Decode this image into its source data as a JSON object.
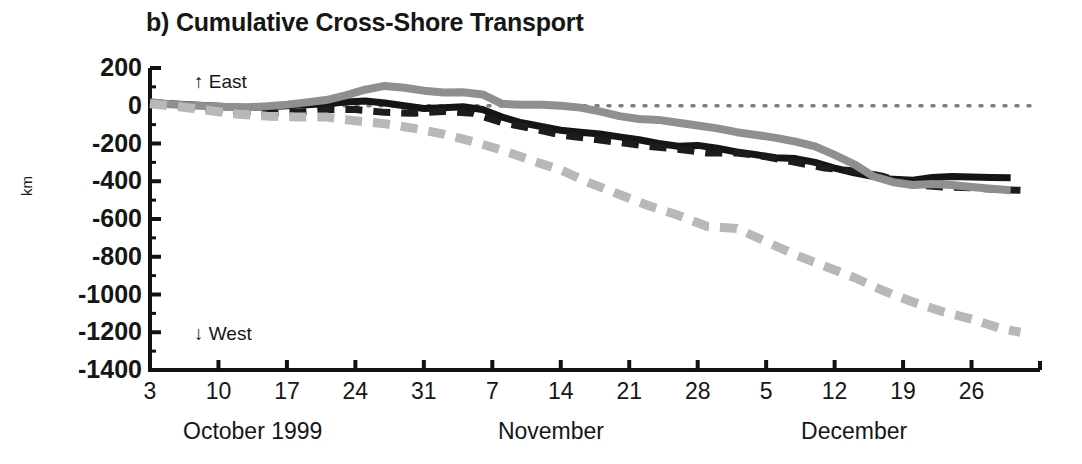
{
  "chart_data": {
    "type": "line",
    "title": "b) Cumulative Cross-Shore Transport",
    "xlabel": "",
    "ylabel": "km",
    "ylim": [
      -1400,
      200
    ],
    "yticks": [
      200,
      0,
      -200,
      -400,
      -600,
      -800,
      -1000,
      -1200,
      -1400
    ],
    "ytick_labels": [
      "200",
      "0",
      "-200",
      "-400",
      "-600",
      "-800",
      "-1000",
      "-1200",
      "-1400"
    ],
    "y_minor_ticks": [
      100,
      -100,
      -300,
      -500,
      -700,
      -900,
      -1100,
      -1300
    ],
    "grid": false,
    "legend": "none",
    "xlim_days": [
      0,
      91
    ],
    "xtick_labels": [
      "3",
      "10",
      "17",
      "24",
      "31",
      "7",
      "14",
      "21",
      "28",
      "5",
      "12",
      "19",
      "26"
    ],
    "xtick_days": [
      0,
      7,
      14,
      21,
      28,
      35,
      42,
      49,
      56,
      63,
      70,
      77,
      84
    ],
    "month_labels": [
      "October 1999",
      "November",
      "December"
    ],
    "month_label_days": [
      10.5,
      41,
      72
    ],
    "annotations": [
      {
        "text": "↑ East",
        "day": 4.5,
        "value": 120
      },
      {
        "text": "↓ West",
        "day": 4.5,
        "value": -1215
      }
    ],
    "reference_line": {
      "value": 0,
      "style": "dotted",
      "color": "#7d7d7d"
    },
    "series": [
      {
        "name": "series-black-solid",
        "color": "#151515",
        "style": "solid",
        "width": 7,
        "x": [
          0,
          2,
          4,
          6,
          8,
          10,
          12,
          14,
          16,
          18,
          20,
          22,
          24,
          26,
          28,
          30,
          32,
          34,
          36,
          38,
          40,
          42,
          44,
          46,
          48,
          50,
          52,
          54,
          56,
          58,
          60,
          62,
          64,
          66,
          68,
          70,
          72,
          74,
          76,
          78,
          80,
          82,
          84,
          86,
          88
        ],
        "y": [
          20,
          10,
          5,
          0,
          -5,
          -10,
          -5,
          0,
          5,
          10,
          20,
          25,
          15,
          0,
          -15,
          -10,
          -5,
          -20,
          -60,
          -90,
          -110,
          -130,
          -140,
          -150,
          -165,
          -180,
          -200,
          -215,
          -210,
          -225,
          -245,
          -260,
          -275,
          -280,
          -300,
          -330,
          -355,
          -375,
          -390,
          -395,
          -380,
          -375,
          -378,
          -380,
          -382
        ]
      },
      {
        "name": "series-black-dashed",
        "color": "#1c1c1c",
        "style": "dashed",
        "width": 7,
        "x": [
          0,
          3,
          6,
          9,
          12,
          15,
          18,
          21,
          24,
          27,
          30,
          33,
          36,
          39,
          42,
          45,
          48,
          51,
          54,
          57,
          60,
          63,
          66,
          69,
          72,
          75,
          78,
          81,
          84,
          87,
          89
        ],
        "y": [
          15,
          0,
          -15,
          -30,
          -40,
          -35,
          -20,
          -20,
          -35,
          -40,
          -30,
          -40,
          -90,
          -120,
          -155,
          -175,
          -195,
          -215,
          -230,
          -250,
          -250,
          -270,
          -300,
          -330,
          -345,
          -375,
          -420,
          -430,
          -435,
          -445,
          -448
        ]
      },
      {
        "name": "series-gray-solid",
        "color": "#8f8f8f",
        "style": "solid",
        "width": 8,
        "x": [
          0,
          2,
          4,
          6,
          8,
          10,
          12,
          14,
          16,
          18,
          20,
          22,
          24,
          26,
          28,
          30,
          32,
          34,
          36,
          38,
          40,
          42,
          44,
          46,
          48,
          50,
          52,
          54,
          56,
          58,
          60,
          62,
          64,
          66,
          68,
          70,
          72,
          74,
          76,
          78,
          80,
          82,
          84,
          86,
          88
        ],
        "y": [
          18,
          8,
          2,
          -2,
          -6,
          -8,
          -2,
          6,
          18,
          30,
          55,
          85,
          105,
          95,
          80,
          70,
          72,
          60,
          10,
          5,
          5,
          0,
          -10,
          -30,
          -55,
          -70,
          -75,
          -90,
          -105,
          -120,
          -140,
          -155,
          -170,
          -190,
          -215,
          -260,
          -310,
          -375,
          -405,
          -420,
          -415,
          -420,
          -430,
          -440,
          -448
        ]
      },
      {
        "name": "series-lightgray-dashed",
        "color": "#b8b8b8",
        "style": "dashed",
        "width": 9,
        "x": [
          0,
          3,
          6,
          9,
          12,
          15,
          18,
          21,
          24,
          27,
          30,
          33,
          36,
          39,
          42,
          45,
          48,
          51,
          54,
          57,
          60,
          63,
          66,
          69,
          72,
          75,
          78,
          81,
          84,
          87,
          89
        ],
        "y": [
          10,
          -5,
          -25,
          -45,
          -55,
          -60,
          -60,
          -80,
          -95,
          -120,
          -150,
          -190,
          -235,
          -290,
          -340,
          -410,
          -470,
          -530,
          -580,
          -640,
          -650,
          -720,
          -790,
          -850,
          -910,
          -980,
          -1040,
          -1090,
          -1130,
          -1180,
          -1200
        ]
      }
    ]
  }
}
